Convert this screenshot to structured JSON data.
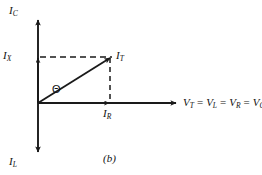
{
  "figure": {
    "caption": "(b)",
    "type": "phasor-diagram",
    "background_color": "#ffffff",
    "line_color": "#1a1a1a"
  },
  "axes": {
    "vertical_up_label": {
      "symbol": "I",
      "subscript": "C"
    },
    "vertical_down_label": {
      "symbol": "I",
      "subscript": "L"
    },
    "horizontal_label_parts": [
      {
        "symbol": "V",
        "subscript": "T"
      },
      {
        "symbol": "V",
        "subscript": "L"
      },
      {
        "symbol": "V",
        "subscript": "R"
      },
      {
        "symbol": "V",
        "subscript": "C"
      }
    ],
    "horizontal_label_operator": "="
  },
  "vectors": [
    {
      "name": "total-current",
      "label": {
        "symbol": "I",
        "subscript": "T"
      },
      "style": "solid-arrow",
      "from": [
        38,
        103
      ],
      "to": [
        110,
        57
      ]
    },
    {
      "name": "resistive-current",
      "label": {
        "symbol": "I",
        "subscript": "R"
      },
      "style": "solid-arrow-on-axis",
      "from": [
        38,
        103
      ],
      "to": [
        110,
        103
      ]
    },
    {
      "name": "reactive-current",
      "label": {
        "symbol": "I",
        "subscript": "X"
      },
      "style": "dashed-projection",
      "from": [
        38,
        103
      ],
      "to": [
        38,
        57
      ]
    }
  ],
  "angle": {
    "name": "phase-angle",
    "symbol": "Θ"
  },
  "projection_lines": [
    {
      "name": "horizontal-dashed",
      "from": [
        38,
        57
      ],
      "to": [
        110,
        57
      ]
    },
    {
      "name": "vertical-dashed",
      "from": [
        110,
        57
      ],
      "to": [
        110,
        103
      ]
    }
  ]
}
